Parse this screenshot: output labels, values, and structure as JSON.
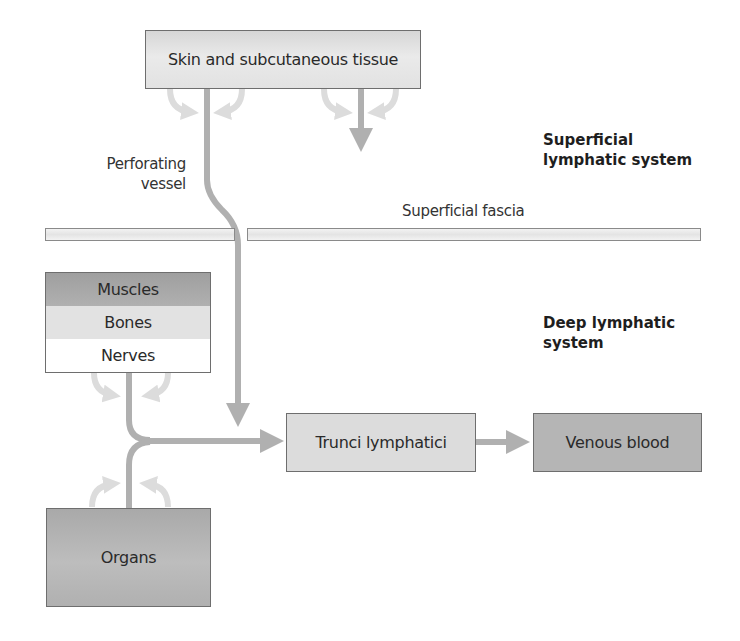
{
  "diagram": {
    "nodes": {
      "skin": {
        "label": "Skin and subcutaneous tissue",
        "color": "#e4e4e4"
      },
      "muscles": {
        "label": "Muscles",
        "color": "#a9a9a9"
      },
      "bones": {
        "label": "Bones",
        "color": "#e2e2e2"
      },
      "nerves": {
        "label": "Nerves",
        "color": "#ffffff"
      },
      "trunci": {
        "label": "Trunci lymphatici",
        "color": "#dcdcdc"
      },
      "venous": {
        "label": "Venous blood",
        "color": "#b5b5b5"
      },
      "organs": {
        "label": "Organs",
        "color": "#b3b3b3"
      }
    },
    "labels": {
      "perforating_line1": "Perforating",
      "perforating_line2": "vessel",
      "superficial_fascia": "Superficial fascia",
      "superficial_system_line1": "Superficial",
      "superficial_system_line2": "lymphatic system",
      "deep_system_line1": "Deep lymphatic",
      "deep_system_line2": "system"
    },
    "colors": {
      "vessel": "#b0b0b0",
      "exchange_arrow": "#dcdcdc",
      "border": "#6e6e6e"
    },
    "edges": [
      {
        "from": "skin",
        "to": "trunci",
        "via": "Perforating vessel"
      },
      {
        "from": "nerves",
        "to": "trunci"
      },
      {
        "from": "organs",
        "to": "trunci"
      },
      {
        "from": "trunci",
        "to": "venous"
      }
    ]
  }
}
